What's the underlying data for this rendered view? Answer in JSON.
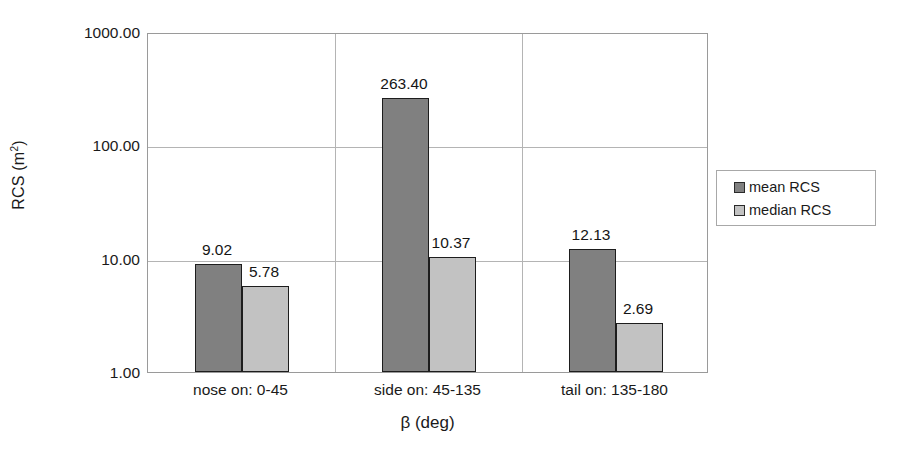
{
  "chart_data": {
    "type": "bar",
    "title": "",
    "xlabel": "β (deg)",
    "ylabel": "RCS (m²)",
    "yscale": "log",
    "ylim": [
      1.0,
      1000.0
    ],
    "ytick_labels": [
      "1000.00",
      "100.00",
      "10.00",
      "1.00"
    ],
    "ytick_values": [
      1000,
      100,
      10,
      1
    ],
    "grid": true,
    "legend_position": "right",
    "categories": [
      "nose on: 0-45",
      "side on: 45-135",
      "tail on: 135-180"
    ],
    "series": [
      {
        "name": "mean RCS",
        "color": "#808080",
        "values": [
          9.02,
          263.4,
          12.13
        ],
        "labels": [
          "9.02",
          "263.40",
          "12.13"
        ]
      },
      {
        "name": "median RCS",
        "color": "#c2c2c2",
        "values": [
          5.78,
          10.37,
          2.69
        ],
        "labels": [
          "5.78",
          "10.37",
          "2.69"
        ]
      }
    ]
  },
  "axis": {
    "y_title_main": "RCS (m",
    "y_title_sup": "2",
    "y_title_close": ")",
    "x_title": "β (deg)"
  },
  "legend": {
    "items": [
      {
        "label": "mean RCS",
        "color": "#808080"
      },
      {
        "label": "median RCS",
        "color": "#c2c2c2"
      }
    ]
  }
}
